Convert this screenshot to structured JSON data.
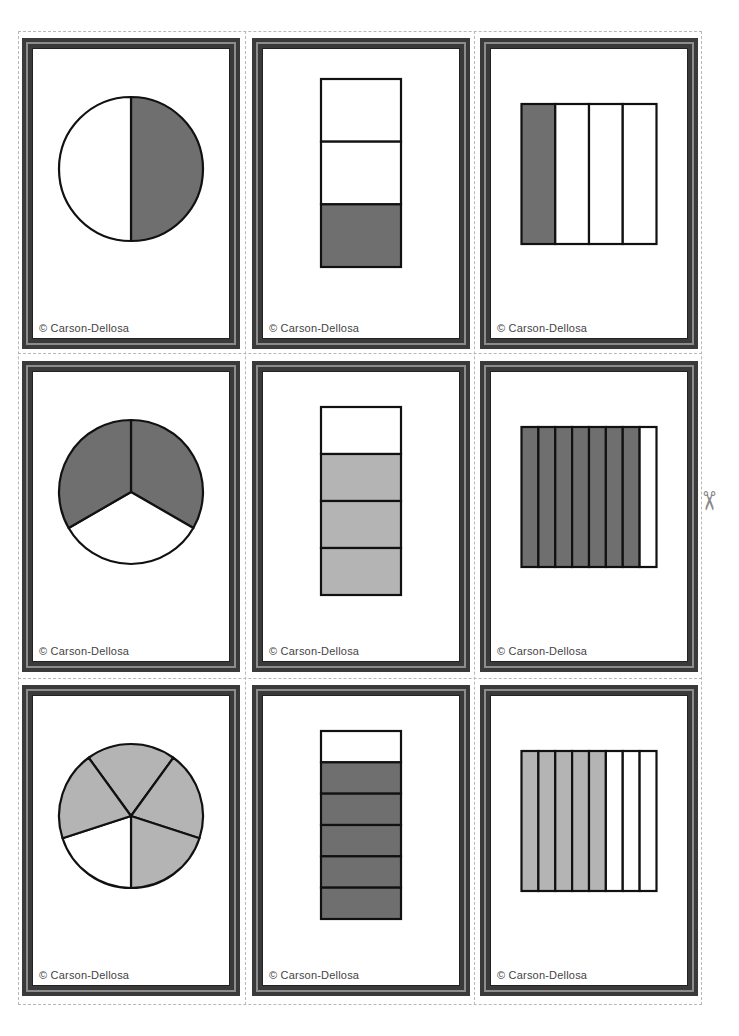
{
  "sheet": {
    "credit": "© Carson-Dellosa",
    "colors": {
      "frame": "#3a3a3a",
      "frame_line": "#8c8c8c",
      "dark_fill": "#6f6f6f",
      "light_fill": "#b4b4b4",
      "outline": "#111111"
    },
    "scissors_icon": "✂"
  },
  "cards": [
    {
      "shape": "circle",
      "parts": 2,
      "shaded": 1,
      "fill": "dark",
      "label": "1/2 circle"
    },
    {
      "shape": "vbar",
      "parts": 3,
      "shaded": 1,
      "fill": "dark",
      "label": "1/3 bar"
    },
    {
      "shape": "hbar",
      "parts": 4,
      "shaded": 1,
      "fill": "dark",
      "label": "1/4 rectangle"
    },
    {
      "shape": "circle",
      "parts": 3,
      "shaded": 2,
      "fill": "dark",
      "label": "2/3 circle"
    },
    {
      "shape": "vbar",
      "parts": 4,
      "shaded": 3,
      "fill": "light",
      "label": "3/4 bar"
    },
    {
      "shape": "hbar",
      "parts": 8,
      "shaded": 7,
      "fill": "dark",
      "label": "7/8 rectangle"
    },
    {
      "shape": "circle",
      "parts": 5,
      "shaded": 4,
      "fill": "light",
      "label": "4/5 circle"
    },
    {
      "shape": "vbar",
      "parts": 6,
      "shaded": 5,
      "fill": "dark",
      "label": "5/6 bar"
    },
    {
      "shape": "hbar",
      "parts": 8,
      "shaded": 5,
      "fill": "light",
      "label": "5/8 rectangle"
    }
  ]
}
